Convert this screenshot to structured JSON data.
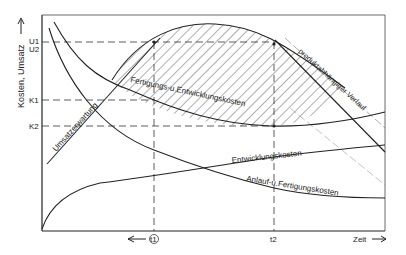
{
  "diagram": {
    "y_axis_label": "Kosten, Umsatz",
    "x_axis_label": "Zeit",
    "y_ticks": {
      "u1": "U1",
      "u2": "U2",
      "k1": "K1",
      "k2": "K2"
    },
    "x_ticks": {
      "t1": "t1",
      "t2": "t2"
    },
    "curves": {
      "umsatzerwartung": "Umsatzerwartung",
      "fertigung_entwicklung": "Fertigungs-u.Entwicklungskosten",
      "produktabhaengig": "produktabhängiger Verlauf",
      "entwicklungskosten": "Entwicklungskosten",
      "anlauf_fertigung": "Anlauf-u.Fertigungskosten"
    },
    "colors": {
      "ink": "#222222",
      "background": "#ffffff"
    }
  }
}
